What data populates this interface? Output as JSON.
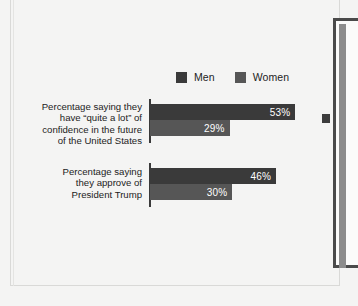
{
  "chart_data": {
    "type": "bar",
    "orientation": "horizontal",
    "title": "",
    "subtitle": "",
    "xlabel": "",
    "ylabel": "",
    "grid": false,
    "legend_position": "top",
    "xlim": [
      0,
      62
    ],
    "categories": [
      "Percentage saying they\nhave “quite a lot” of\nconfidence in the future\nof the United States",
      "Percentage saying\nthey approve of\nPresident Trump"
    ],
    "series": [
      {
        "name": "Men",
        "color": "#3a3a3a",
        "values": [
          53,
          46
        ],
        "value_labels": [
          "53%",
          "30%"
        ]
      },
      {
        "name": "Women",
        "color": "#565656",
        "values": [
          29,
          30
        ],
        "value_labels": [
          "29%",
          "30%"
        ]
      }
    ],
    "bars": [
      {
        "category_index": 0,
        "series": "Men",
        "value": 53,
        "label": "53%"
      },
      {
        "category_index": 0,
        "series": "Women",
        "value": 29,
        "label": "29%"
      },
      {
        "category_index": 1,
        "series": "Men",
        "value": 46,
        "label": "46%"
      },
      {
        "category_index": 1,
        "series": "Women",
        "value": 30,
        "label": "30%"
      }
    ]
  },
  "legend": {
    "items": [
      {
        "label": "Men",
        "color": "#3a3a3a",
        "swatch_name": "legend-swatch-men"
      },
      {
        "label": "Women",
        "color": "#565656",
        "swatch_name": "legend-swatch-women"
      }
    ]
  },
  "colors": {
    "page_background": "#f4f4f3",
    "series_men": "#3a3a3a",
    "series_women": "#565656",
    "axis": "#3a3a3a",
    "text": "#1c1c1c",
    "value_text": "#ffffff",
    "frame_border": "#d9d9d7",
    "side_panel_border": "#4a4a4a"
  }
}
